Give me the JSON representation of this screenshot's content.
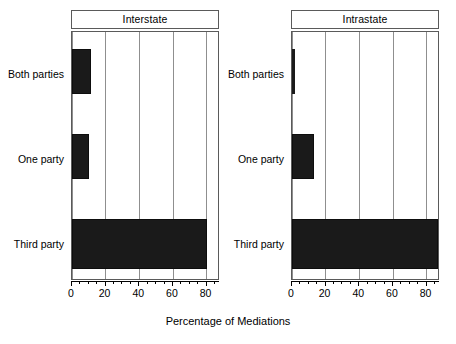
{
  "chart_data": {
    "type": "bar",
    "orientation": "horizontal",
    "title": "",
    "xlabel": "Percentage of Mediations",
    "ylabel": "",
    "xlim": [
      0,
      88
    ],
    "xticks": [
      0,
      20,
      40,
      60,
      80
    ],
    "xticklabels": [
      "0",
      "20",
      "40",
      "60",
      "80"
    ],
    "minor_ticks_between": 3,
    "grid": "vertical-major",
    "legend": "none",
    "bar_color": "#1a1a1a",
    "categories": [
      "Both parties",
      "One party",
      "Third party"
    ],
    "panels": [
      {
        "title": "Interstate",
        "values": [
          11,
          10,
          80
        ]
      },
      {
        "title": "Intrastate",
        "values": [
          2,
          13,
          87
        ]
      }
    ],
    "series": [
      {
        "name": "Interstate",
        "values": [
          11,
          10,
          80
        ]
      },
      {
        "name": "Intrastate",
        "values": [
          2,
          13,
          87
        ]
      }
    ]
  }
}
